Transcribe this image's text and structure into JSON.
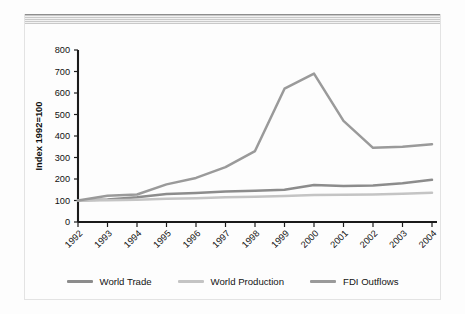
{
  "chart_data": {
    "type": "line",
    "title": "",
    "subtitle": "",
    "xlabel": "",
    "ylabel": "Index 1992=100",
    "categories": [
      "1992",
      "1993",
      "1994",
      "1995",
      "1996",
      "1997",
      "1998",
      "1999",
      "2000",
      "2001",
      "2002",
      "2003",
      "2004"
    ],
    "x": [
      1992,
      1993,
      1994,
      1995,
      1996,
      1997,
      1998,
      1999,
      2000,
      2001,
      2002,
      2003,
      2004
    ],
    "ylim": [
      0,
      800
    ],
    "yticks": [
      0,
      100,
      200,
      300,
      400,
      500,
      600,
      700,
      800
    ],
    "grid": false,
    "legend_position": "bottom",
    "series": [
      {
        "name": "World Trade",
        "color": "#8c8c8c",
        "values": [
          100,
          105,
          115,
          130,
          135,
          142,
          145,
          150,
          172,
          168,
          170,
          180,
          196
        ]
      },
      {
        "name": "World Production",
        "color": "#c4c4c4",
        "values": [
          100,
          101,
          104,
          108,
          111,
          115,
          118,
          121,
          126,
          127,
          128,
          131,
          136
        ]
      },
      {
        "name": "FDI Outflows",
        "color": "#9a9a9a",
        "values": [
          100,
          122,
          128,
          175,
          205,
          255,
          330,
          620,
          690,
          470,
          345,
          350,
          362
        ]
      }
    ]
  },
  "axes": {
    "y_axis_title": "Index 1992=100",
    "y_tick_labels": [
      "0",
      "100",
      "200",
      "300",
      "400",
      "500",
      "600",
      "700",
      "800"
    ],
    "x_tick_labels": [
      "1992",
      "1993",
      "1994",
      "1995",
      "1996",
      "1997",
      "1998",
      "1999",
      "2000",
      "2001",
      "2002",
      "2003",
      "2004"
    ]
  },
  "legend": {
    "items": [
      {
        "label": "World Trade",
        "color": "#8c8c8c"
      },
      {
        "label": "World Production",
        "color": "#c4c4c4"
      },
      {
        "label": "FDI Outflows",
        "color": "#9a9a9a"
      }
    ]
  },
  "decor": {
    "band_name": "top-hatched-band"
  }
}
